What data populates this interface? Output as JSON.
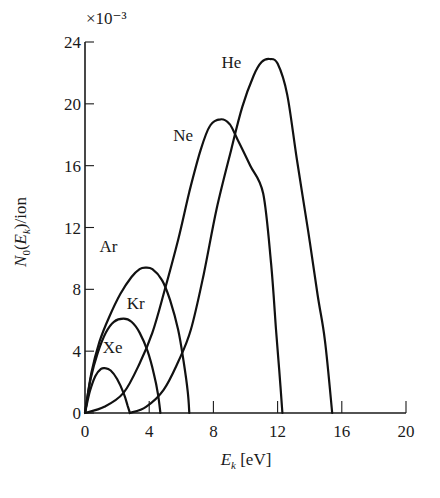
{
  "chart_data": {
    "type": "line",
    "title": "",
    "xlabel": "E_k [eV]",
    "ylabel": "N0(Ek)/ion",
    "y_multiplier": "×10⁻³",
    "xlim": [
      0,
      20
    ],
    "ylim": [
      0,
      24
    ],
    "xticks": [
      0,
      4,
      8,
      12,
      16,
      20
    ],
    "yticks": [
      0,
      4,
      8,
      12,
      16,
      20,
      24
    ],
    "grid": false,
    "legend": "inline labels",
    "series": [
      {
        "name": "He",
        "label_pos": [
          8.5,
          22.3
        ],
        "points": [
          [
            2.8,
            0
          ],
          [
            3.8,
            0.4
          ],
          [
            4.9,
            1.5
          ],
          [
            5.8,
            3.3
          ],
          [
            6.6,
            5.4
          ],
          [
            7.4,
            9.0
          ],
          [
            8.2,
            13.2
          ],
          [
            9.1,
            17.0
          ],
          [
            9.8,
            19.8
          ],
          [
            10.5,
            21.8
          ],
          [
            11.0,
            22.7
          ],
          [
            11.5,
            22.9
          ],
          [
            12.0,
            22.6
          ],
          [
            12.6,
            20.6
          ],
          [
            13.2,
            16.4
          ],
          [
            13.9,
            11.8
          ],
          [
            14.5,
            7.6
          ],
          [
            14.95,
            4.7
          ],
          [
            15.4,
            0
          ]
        ]
      },
      {
        "name": "Ne",
        "label_pos": [
          5.5,
          17.6
        ],
        "points": [
          [
            0,
            0
          ],
          [
            1.2,
            0.4
          ],
          [
            2.4,
            1.3
          ],
          [
            3.4,
            3.2
          ],
          [
            4.2,
            5.2
          ],
          [
            4.9,
            7.7
          ],
          [
            5.8,
            11.2
          ],
          [
            6.5,
            14.3
          ],
          [
            7.2,
            17.0
          ],
          [
            7.8,
            18.6
          ],
          [
            8.45,
            19.0
          ],
          [
            9.0,
            18.7
          ],
          [
            9.5,
            17.7
          ],
          [
            10.3,
            16.0
          ],
          [
            11.1,
            14.2
          ],
          [
            11.6,
            9.6
          ],
          [
            11.9,
            5.4
          ],
          [
            12.1,
            2.8
          ],
          [
            12.3,
            0
          ]
        ]
      },
      {
        "name": "Ar",
        "label_pos": [
          0.9,
          10.4
        ],
        "points": [
          [
            0,
            0
          ],
          [
            0.4,
            2.6
          ],
          [
            0.9,
            4.6
          ],
          [
            1.5,
            6.2
          ],
          [
            2.2,
            7.7
          ],
          [
            2.9,
            8.8
          ],
          [
            3.4,
            9.3
          ],
          [
            3.75,
            9.4
          ],
          [
            4.2,
            9.3
          ],
          [
            4.8,
            8.6
          ],
          [
            5.3,
            7.3
          ],
          [
            5.8,
            5.4
          ],
          [
            6.15,
            3.3
          ],
          [
            6.4,
            1.4
          ],
          [
            6.5,
            0
          ]
        ]
      },
      {
        "name": "Kr",
        "label_pos": [
          2.6,
          6.7
        ],
        "points": [
          [
            0,
            0
          ],
          [
            0.35,
            2.2
          ],
          [
            0.8,
            3.9
          ],
          [
            1.3,
            5.2
          ],
          [
            1.8,
            5.9
          ],
          [
            2.4,
            6.1
          ],
          [
            2.9,
            5.9
          ],
          [
            3.4,
            5.2
          ],
          [
            3.9,
            4.0
          ],
          [
            4.3,
            2.5
          ],
          [
            4.55,
            1.2
          ],
          [
            4.7,
            0
          ]
        ]
      },
      {
        "name": "Xe",
        "label_pos": [
          1.1,
          3.9
        ],
        "points": [
          [
            0,
            0
          ],
          [
            0.3,
            1.4
          ],
          [
            0.65,
            2.4
          ],
          [
            1.0,
            2.85
          ],
          [
            1.25,
            2.9
          ],
          [
            1.6,
            2.75
          ],
          [
            2.0,
            2.2
          ],
          [
            2.4,
            1.3
          ],
          [
            2.65,
            0.5
          ],
          [
            2.8,
            0
          ]
        ]
      }
    ]
  },
  "plot_area": {
    "x0_px": 85,
    "x1_px": 406,
    "y0_px": 413,
    "y1_px": 42
  }
}
